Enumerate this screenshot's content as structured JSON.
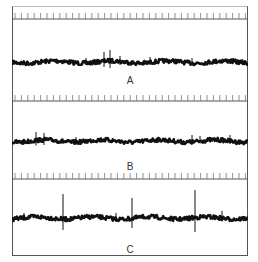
{
  "figure": {
    "panels": [
      {
        "id": "A",
        "label": "A",
        "top": 6,
        "axis_y": 13,
        "trace_y": 56,
        "label_y": 78,
        "spikes": [
          {
            "x": 92,
            "h": 10
          },
          {
            "x": 98,
            "h": 12
          },
          {
            "x": 108,
            "h": 6
          },
          {
            "x": 74,
            "h": 4
          },
          {
            "x": 138,
            "h": 5
          },
          {
            "x": 180,
            "h": 4
          }
        ]
      },
      {
        "id": "B",
        "label": "B",
        "top": 88,
        "axis_y": 13,
        "trace_y": 53,
        "label_y": 74,
        "spikes": [
          {
            "x": 24,
            "h": 9
          },
          {
            "x": 32,
            "h": 8
          },
          {
            "x": 64,
            "h": 4
          },
          {
            "x": 180,
            "h": 6
          },
          {
            "x": 188,
            "h": 5
          },
          {
            "x": 218,
            "h": 6
          }
        ]
      },
      {
        "id": "C",
        "label": "C",
        "top": 166,
        "axis_y": 13,
        "trace_y": 52,
        "label_y": 80,
        "spikes": [
          {
            "x": 51,
            "h": 24
          },
          {
            "x": 120,
            "h": 20
          },
          {
            "x": 183,
            "h": 28
          },
          {
            "x": 12,
            "h": 5
          },
          {
            "x": 104,
            "h": 5
          },
          {
            "x": 210,
            "h": 7
          }
        ]
      }
    ],
    "tick_count": 37,
    "tick_spacing": 6.4,
    "colors": {
      "trace": "#111111",
      "axis": "#555555",
      "ticks": "#777777"
    }
  }
}
